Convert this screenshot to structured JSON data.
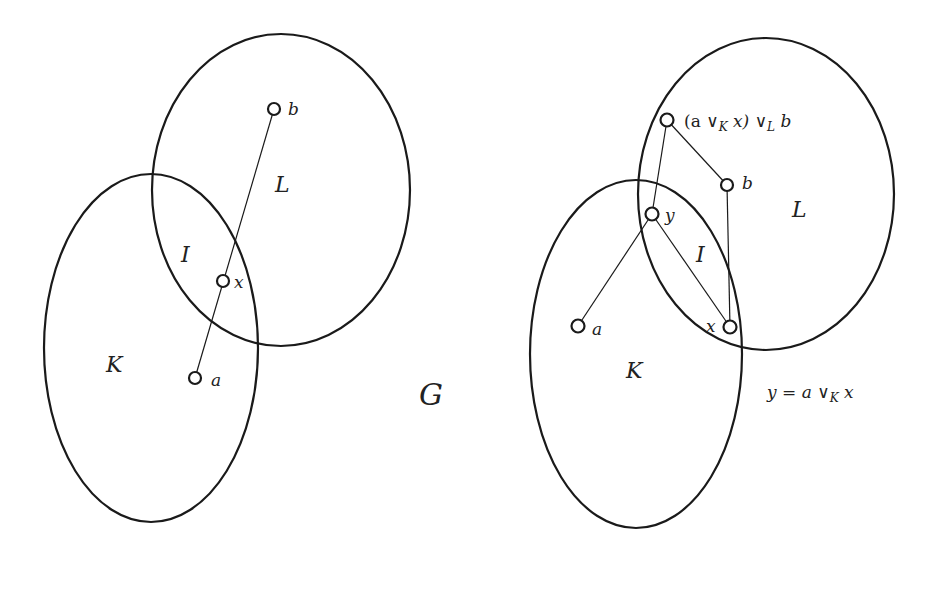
{
  "diagram": {
    "left": {
      "sets": [
        {
          "name": "L",
          "label": "L"
        },
        {
          "name": "K",
          "label": "K"
        },
        {
          "name": "I",
          "label": "I"
        }
      ],
      "vertices": [
        {
          "id": "b",
          "label": "b"
        },
        {
          "id": "x",
          "label": "x"
        },
        {
          "id": "a",
          "label": "a"
        }
      ],
      "edges": [
        [
          "b",
          "a"
        ]
      ]
    },
    "graph_label": "G",
    "right": {
      "sets": [
        {
          "name": "L",
          "label": "L"
        },
        {
          "name": "K",
          "label": "K"
        },
        {
          "name": "I",
          "label": "I"
        }
      ],
      "vertices": [
        {
          "id": "top",
          "label_parts": {
            "open": "(a ",
            "vee1": "∨",
            "sub1": "K",
            "mid": " x) ",
            "vee2": "∨",
            "sub2": "L",
            "end": " b"
          }
        },
        {
          "id": "b",
          "label": "b"
        },
        {
          "id": "y",
          "label": "y"
        },
        {
          "id": "a",
          "label": "a"
        },
        {
          "id": "x",
          "label": "x"
        }
      ],
      "edges": [
        [
          "top",
          "y"
        ],
        [
          "top",
          "b"
        ],
        [
          "b",
          "x"
        ],
        [
          "y",
          "x"
        ],
        [
          "y",
          "a"
        ]
      ],
      "equation": {
        "lhs": "y = a ",
        "vee": "∨",
        "sub": "K",
        "rhs": " x"
      }
    }
  }
}
